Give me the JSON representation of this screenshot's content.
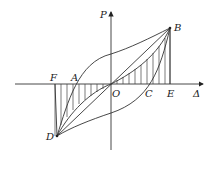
{
  "diagram": {
    "type": "hysteresis-loop",
    "axes": {
      "y_label": "P",
      "x_label": "Δ"
    },
    "points": {
      "O": "O",
      "A": "A",
      "B": "B",
      "C": "C",
      "D": "D",
      "E": "E",
      "F": "F"
    },
    "regions": [
      {
        "name": "triangle-OBE",
        "hatched": true
      },
      {
        "name": "triangle-ODF",
        "hatched": true
      }
    ]
  }
}
